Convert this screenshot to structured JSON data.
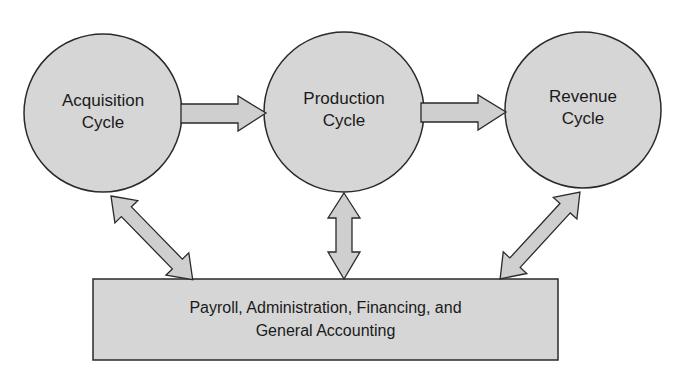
{
  "diagram": {
    "colors": {
      "fill": "#d6d6d6",
      "stroke": "#2a2a2a",
      "background": "#ffffff"
    },
    "nodes": [
      {
        "id": "acquisition",
        "line1": "Acquisition",
        "line2": "Cycle"
      },
      {
        "id": "production",
        "line1": "Production",
        "line2": "Cycle"
      },
      {
        "id": "revenue",
        "line1": "Revenue",
        "line2": "Cycle"
      }
    ],
    "box": {
      "line1": "Payroll, Administration, Financing, and",
      "line2": "General Accounting"
    },
    "edges": [
      {
        "from": "acquisition",
        "to": "production",
        "type": "one-way"
      },
      {
        "from": "production",
        "to": "revenue",
        "type": "one-way"
      },
      {
        "from": "acquisition",
        "to": "box",
        "type": "two-way"
      },
      {
        "from": "production",
        "to": "box",
        "type": "two-way"
      },
      {
        "from": "revenue",
        "to": "box",
        "type": "two-way"
      }
    ]
  }
}
